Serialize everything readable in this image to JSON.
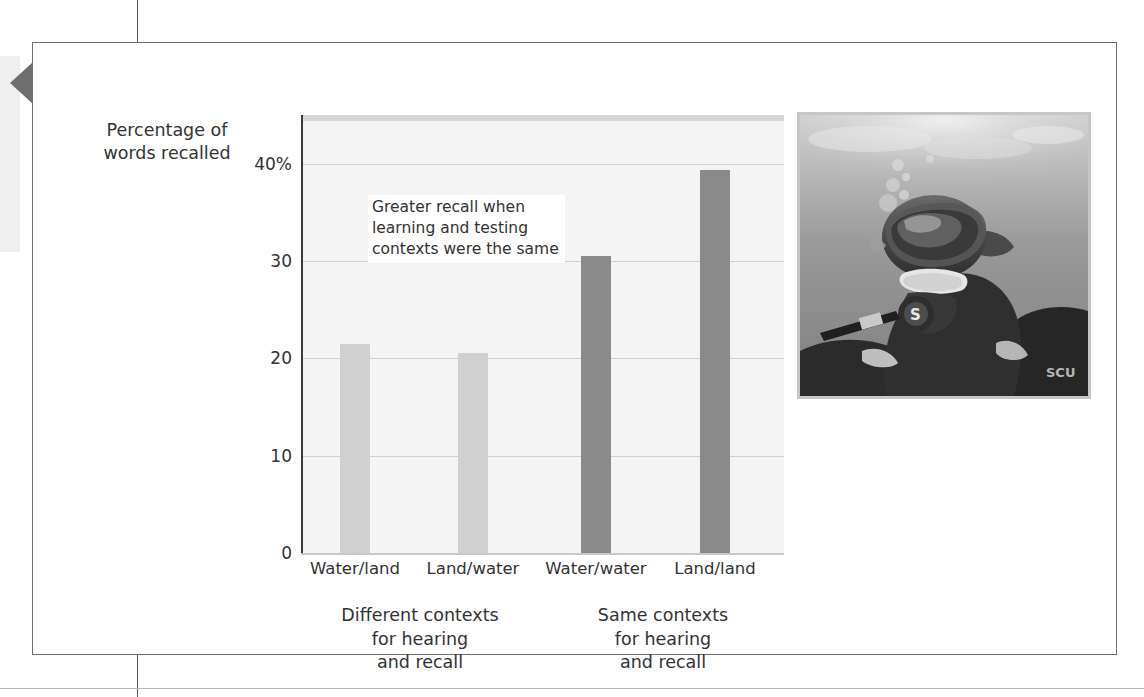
{
  "figure": {
    "axis_title": "Percentage of\nwords recalled",
    "callout": "Greater recall when\nlearning and testing\ncontexts were the same",
    "group_labels": [
      "Different contexts\nfor hearing\nand recall",
      "Same contexts\nfor hearing\nand recall"
    ],
    "photo_credit": "Fred McConnaughey/Photo Researchers",
    "photo_alt": "scuba-diver-underwater-photo"
  },
  "colors": {
    "bar_light": "#d0d0d0",
    "bar_dark": "#8a8a8a",
    "plot_background": "#f4f4f4",
    "gridline": "#cfcfcf",
    "axis": "#3c3c3c",
    "frame_border": "#6f6f6f",
    "text": "#333333"
  },
  "chart_data": {
    "type": "bar",
    "title": "",
    "xlabel": "",
    "ylabel": "Percentage of words recalled",
    "categories": [
      "Water/land",
      "Land/water",
      "Water/water",
      "Land/land"
    ],
    "values": [
      21.5,
      20.6,
      30.5,
      39.3
    ],
    "bar_colors": [
      "#d0d0d0",
      "#d0d0d0",
      "#8a8a8a",
      "#8a8a8a"
    ],
    "groups": [
      {
        "label": "Different contexts for hearing and recall",
        "categories": [
          "Water/land",
          "Land/water"
        ]
      },
      {
        "label": "Same contexts for hearing and recall",
        "categories": [
          "Water/water",
          "Land/land"
        ]
      }
    ],
    "ylim": [
      0,
      45
    ],
    "yticks": [
      0,
      10,
      20,
      30,
      40
    ],
    "ytick_labels": [
      "0",
      "10",
      "20",
      "30",
      "40%"
    ],
    "grid": true,
    "legend": "none",
    "annotations": [
      {
        "text": "Greater recall when learning and testing contexts were the same"
      }
    ]
  }
}
